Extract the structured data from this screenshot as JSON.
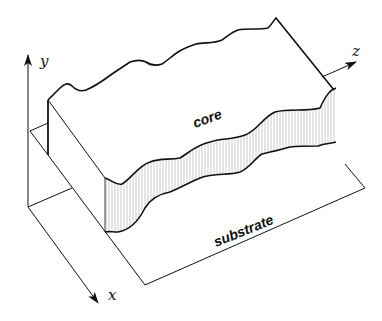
{
  "diagram": {
    "type": "3D waveguide schematic",
    "labels": {
      "core": "core",
      "substrate": "substrate"
    },
    "axes": {
      "x": "x",
      "y": "y",
      "z": "z"
    },
    "colors": {
      "stroke": "#111111",
      "hatch": "#9a9a9a",
      "background": "#ffffff"
    }
  }
}
